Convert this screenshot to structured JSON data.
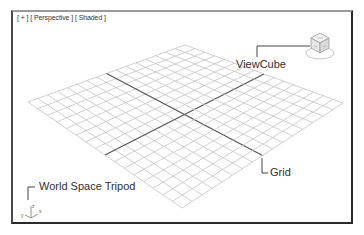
{
  "viewport": {
    "label_parts": [
      "[ + ]",
      "[ Perspective ]",
      "[ Shaded ]"
    ]
  },
  "callouts": {
    "viewcube": "ViewCube",
    "grid": "Grid",
    "tripod": "World Space Tripod"
  },
  "tripod_axes": {
    "z": "z",
    "x": "x",
    "y": "y"
  },
  "grid": {
    "divisions": 16,
    "corners": {
      "top": [
        185,
        45
      ],
      "right": [
        343,
        103
      ],
      "bottom": [
        182,
        208
      ],
      "left": [
        28,
        102
      ]
    },
    "line_color": "#c4c4c4",
    "axis_color": "#555555"
  },
  "colors": {
    "frame": "#2a2a2a",
    "text": "#2e2e2e"
  }
}
